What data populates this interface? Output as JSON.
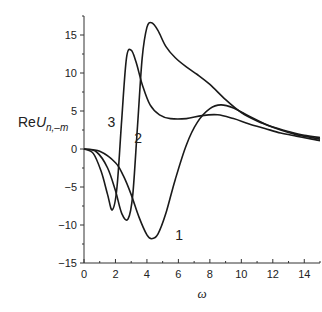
{
  "chart_data": {
    "type": "line",
    "title": "",
    "xlabel": "ω",
    "ylabel": "ReU_{n,-m}",
    "ylabel_display": {
      "prefix": "Re",
      "main": "U",
      "sub": "n,–m"
    },
    "xlim": [
      0,
      15
    ],
    "ylim": [
      -15,
      17.5
    ],
    "xticks": [
      0,
      2,
      4,
      6,
      8,
      10,
      12,
      14
    ],
    "yticks": [
      -15,
      -10,
      -5,
      0,
      5,
      10,
      15
    ],
    "grid": false,
    "legend": "inline curve labels",
    "series": [
      {
        "name": "1",
        "label_pos": [
          5.8,
          -11.3
        ],
        "x": [
          0,
          1,
          2,
          2.5,
          3,
          3.5,
          4,
          4.3,
          4.7,
          5.2,
          5.8,
          6.5,
          7.2,
          8,
          8.7,
          9.5,
          10.5,
          11.5,
          12.5,
          13.5,
          14.5,
          15
        ],
        "y": [
          0,
          -0.3,
          -1.8,
          -3.5,
          -6,
          -9,
          -11.3,
          -11.8,
          -11.2,
          -8.5,
          -4,
          0.5,
          3.5,
          5.3,
          5.8,
          5.4,
          4.3,
          3.3,
          2.5,
          1.9,
          1.5,
          1.3
        ]
      },
      {
        "name": "2",
        "label_pos": [
          3.2,
          1.5
        ],
        "x": [
          0,
          0.8,
          1.5,
          2,
          2.4,
          2.8,
          3.1,
          3.4,
          3.7,
          4,
          4.3,
          4.7,
          5.2,
          5.8,
          6.5,
          7.2,
          8,
          9,
          10,
          11,
          12,
          13,
          14,
          15
        ],
        "y": [
          0,
          -0.4,
          -2.5,
          -5.5,
          -8.5,
          -9.2,
          -6,
          3,
          12,
          16,
          16.6,
          15.6,
          13.5,
          12,
          10.8,
          9.8,
          8.5,
          6.5,
          4.8,
          3.7,
          2.9,
          2.3,
          1.8,
          1.5
        ]
      },
      {
        "name": "3",
        "label_pos": [
          1.5,
          3.5
        ],
        "x": [
          0,
          0.6,
          1.1,
          1.5,
          1.8,
          2.1,
          2.4,
          2.7,
          3,
          3.3,
          3.7,
          4.2,
          4.8,
          5.5,
          6.5,
          7.5,
          8.5,
          9.5,
          10.5,
          11.5,
          12.5,
          13.5,
          14.5,
          15
        ],
        "y": [
          0,
          -0.6,
          -3,
          -6,
          -8,
          -5,
          4,
          12,
          13,
          11.5,
          8.5,
          5.8,
          4.5,
          4,
          4,
          4.4,
          4.5,
          4,
          3.3,
          2.7,
          2.1,
          1.7,
          1.3,
          1.1
        ]
      }
    ]
  },
  "colors": {
    "curve": "#1a1a1a",
    "axis": "#333333",
    "background": "#ffffff"
  }
}
